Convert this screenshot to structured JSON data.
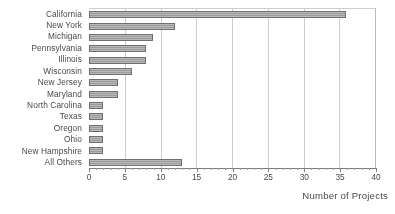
{
  "chart_data": {
    "type": "bar",
    "orientation": "horizontal",
    "title": "",
    "xlabel": "Number of Projects",
    "ylabel": "",
    "xlim": [
      0,
      40
    ],
    "ylim": null,
    "grid": true,
    "legend": null,
    "xticks": [
      0,
      5,
      10,
      15,
      20,
      25,
      30,
      35,
      40
    ],
    "xticklabels": [
      "0",
      "5",
      "10",
      "15",
      "20",
      "25",
      "30",
      "35",
      "40"
    ],
    "categories": [
      "California",
      "New York",
      "Michigan",
      "Pennsylvania",
      "Illinois",
      "Wisconsin",
      "New Jersey",
      "Maryland",
      "North Carolina",
      "Texas",
      "Oregon",
      "Ohio",
      "New Hampshire",
      "All Others"
    ],
    "values": [
      36,
      12,
      9,
      8,
      8,
      6,
      4,
      4,
      2,
      2,
      2,
      2,
      2,
      13
    ],
    "bar_color": "#9b9b9b",
    "bar_edge_color": "#6f6f6f",
    "gridline_color": "#cccccc",
    "axis_color": "#7d7d7d",
    "text_color": "#494949"
  }
}
